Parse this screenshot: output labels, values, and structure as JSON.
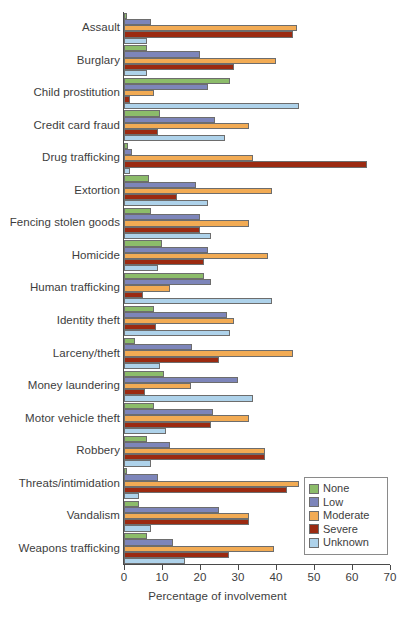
{
  "chart_data": {
    "type": "bar",
    "orientation": "horizontal",
    "title": "",
    "xlabel": "Percentage of involvement",
    "ylabel": "",
    "xlim": [
      0,
      70
    ],
    "xticks": [
      0,
      10,
      20,
      30,
      40,
      50,
      60,
      70
    ],
    "grid": false,
    "legend_position": "bottom-right",
    "categories": [
      "Assault",
      "Burglary",
      "Child prostitution",
      "Credit card fraud",
      "Drug trafficking",
      "Extortion",
      "Fencing stolen goods",
      "Homicide",
      "Human trafficking",
      "Identity theft",
      "Larceny/theft",
      "Money laundering",
      "Motor vehicle theft",
      "Robbery",
      "Threats/intimidation",
      "Vandalism",
      "Weapons trafficking"
    ],
    "series": [
      {
        "name": "None",
        "color": "#8cbc6a",
        "values": [
          0.8,
          6.0,
          28.0,
          9.5,
          1.0,
          6.5,
          7.0,
          10.0,
          21.0,
          8.0,
          3.0,
          10.5,
          8.0,
          6.0,
          0.7,
          4.0,
          6.0
        ]
      },
      {
        "name": "Low",
        "color": "#7d85ba",
        "values": [
          7.0,
          20.0,
          22.0,
          24.0,
          2.0,
          19.0,
          20.0,
          22.0,
          23.0,
          27.0,
          18.0,
          30.0,
          23.5,
          12.0,
          9.0,
          25.0,
          13.0
        ]
      },
      {
        "name": "Moderate",
        "color": "#f2ab54",
        "values": [
          45.5,
          40.0,
          8.0,
          33.0,
          34.0,
          39.0,
          33.0,
          38.0,
          12.0,
          29.0,
          44.5,
          17.5,
          33.0,
          37.0,
          46.0,
          33.0,
          39.5
        ]
      },
      {
        "name": "Severe",
        "color": "#9b2a11",
        "values": [
          44.5,
          29.0,
          1.5,
          9.0,
          64.0,
          14.0,
          20.0,
          21.0,
          5.0,
          8.5,
          25.0,
          5.5,
          23.0,
          37.0,
          43.0,
          33.0,
          27.5
        ]
      },
      {
        "name": "Unknown",
        "color": "#aed2ea",
        "values": [
          6.0,
          6.0,
          46.0,
          26.5,
          1.5,
          22.0,
          23.0,
          9.0,
          39.0,
          28.0,
          9.5,
          34.0,
          11.0,
          7.0,
          4.0,
          7.0,
          16.0
        ]
      }
    ]
  },
  "legend": {
    "items": [
      {
        "label": "None"
      },
      {
        "label": "Low"
      },
      {
        "label": "Moderate"
      },
      {
        "label": "Severe"
      },
      {
        "label": "Unknown"
      }
    ]
  },
  "axis": {
    "x_title": "Percentage of involvement",
    "x_tick_labels": [
      "0",
      "10",
      "20",
      "30",
      "40",
      "50",
      "60",
      "70"
    ]
  }
}
